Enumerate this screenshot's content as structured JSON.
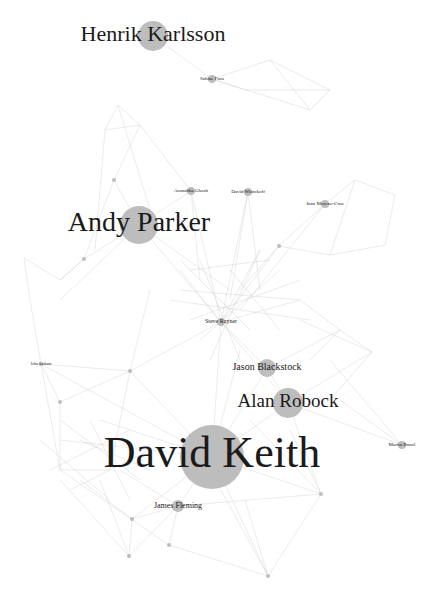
{
  "diagram": {
    "type": "network-graph",
    "colors": {
      "background": "#ffffff",
      "edge": "#c8c8c8",
      "node": "#bdbdbd",
      "label": "#1a1a1a"
    },
    "nodes": [
      {
        "id": "henrik-karlsson",
        "label": "Henrik Karlsson",
        "x": 153,
        "y": 36,
        "r": 15,
        "fs": 22
      },
      {
        "id": "sabine-fuss",
        "label": "Sabine Fuss",
        "x": 212,
        "y": 79,
        "r": 4,
        "fs": 5
      },
      {
        "id": "andy-parker",
        "label": "Andy Parker",
        "x": 139,
        "y": 225,
        "r": 19,
        "fs": 28
      },
      {
        "id": "arunabha-ghosh",
        "label": "Arunabha Ghosh",
        "x": 191,
        "y": 191,
        "r": 4,
        "fs": 5
      },
      {
        "id": "david-winickoff",
        "label": "David Winickoff",
        "x": 248,
        "y": 192,
        "r": 4,
        "fs": 5
      },
      {
        "id": "juan-moreno-cruz",
        "label": "Juan Moreno-Cruz",
        "x": 325,
        "y": 204,
        "r": 4,
        "fs": 5
      },
      {
        "id": "small-1",
        "label": "",
        "x": 114,
        "y": 180,
        "r": 2,
        "fs": 3
      },
      {
        "id": "small-2",
        "label": "",
        "x": 279,
        "y": 246,
        "r": 2,
        "fs": 3
      },
      {
        "id": "small-3",
        "label": "",
        "x": 84,
        "y": 259,
        "r": 2,
        "fs": 3
      },
      {
        "id": "steve-rayner",
        "label": "Steve Rayner",
        "x": 221,
        "y": 322,
        "r": 4,
        "fs": 6
      },
      {
        "id": "jason-blackstock",
        "label": "Jason Blackstock",
        "x": 267,
        "y": 368,
        "r": 9,
        "fs": 10
      },
      {
        "id": "alan-robock",
        "label": "Alan Robock",
        "x": 288,
        "y": 403,
        "r": 15,
        "fs": 19
      },
      {
        "id": "david-keith",
        "label": "David Keith",
        "x": 212,
        "y": 457,
        "r": 32,
        "fs": 44
      },
      {
        "id": "martin-bunzl",
        "label": "Martin Bunzl",
        "x": 402,
        "y": 445,
        "r": 4,
        "fs": 5
      },
      {
        "id": "james-fleming",
        "label": "James Fleming",
        "x": 178,
        "y": 506,
        "r": 6,
        "fs": 8
      },
      {
        "id": "john-latham",
        "label": "John Latham",
        "x": 41,
        "y": 364,
        "r": 2,
        "fs": 4
      },
      {
        "id": "small-4",
        "label": "",
        "x": 130,
        "y": 371,
        "r": 2,
        "fs": 3
      },
      {
        "id": "small-5",
        "label": "",
        "x": 60,
        "y": 402,
        "r": 2,
        "fs": 3
      },
      {
        "id": "small-6",
        "label": "",
        "x": 321,
        "y": 494,
        "r": 2,
        "fs": 3
      },
      {
        "id": "small-7",
        "label": "",
        "x": 132,
        "y": 519,
        "r": 2,
        "fs": 3
      },
      {
        "id": "small-8",
        "label": "",
        "x": 169,
        "y": 545,
        "r": 2,
        "fs": 3
      },
      {
        "id": "small-9",
        "label": "",
        "x": 129,
        "y": 556,
        "r": 2,
        "fs": 3
      },
      {
        "id": "small-10",
        "label": "",
        "x": 268,
        "y": 576,
        "r": 2,
        "fs": 3
      }
    ],
    "edges": [
      [
        "henrik-karlsson",
        "sabine-fuss"
      ],
      [
        212,
        79,
        270,
        60
      ],
      [
        270,
        60,
        330,
        90
      ],
      [
        330,
        90,
        310,
        110
      ],
      [
        310,
        110,
        212,
        79
      ],
      [
        270,
        60,
        310,
        110
      ],
      [
        330,
        90,
        245,
        90
      ],
      [
        245,
        90,
        212,
        79
      ],
      [
        118,
        105,
        140,
        125
      ],
      [
        140,
        125,
        105,
        130
      ],
      [
        105,
        130,
        118,
        105
      ],
      [
        118,
        105,
        150,
        210
      ],
      [
        140,
        125,
        190,
        190
      ],
      [
        105,
        130,
        95,
        250
      ],
      [
        "small-1",
        "andy-parker"
      ],
      [
        "small-1",
        "small-3"
      ],
      [
        "small-1",
        140,
        125
      ],
      [
        "arunabha-ghosh",
        "andy-parker"
      ],
      [
        "arunabha-ghosh",
        "steve-rayner"
      ],
      [
        "arunabha-ghosh",
        200,
        280
      ],
      [
        "david-winickoff",
        230,
        300
      ],
      [
        "david-winickoff",
        "steve-rayner"
      ],
      [
        "david-winickoff",
        260,
        290
      ],
      [
        "juan-moreno-cruz",
        "small-2"
      ],
      [
        "juan-moreno-cruz",
        355,
        180
      ],
      [
        355,
        180,
        395,
        195
      ],
      [
        395,
        195,
        385,
        245
      ],
      [
        385,
        245,
        330,
        255
      ],
      [
        330,
        255,
        355,
        180
      ],
      [
        "juan-moreno-cruz",
        240,
        310
      ],
      [
        "small-2",
        "steve-rayner"
      ],
      [
        "small-2",
        240,
        290
      ],
      [
        "small-2",
        330,
        255
      ],
      [
        24,
        258,
        30,
        300
      ],
      [
        24,
        258,
        60,
        280
      ],
      [
        60,
        280,
        84,
        259
      ],
      [
        30,
        300,
        41,
        364
      ],
      [
        "small-3",
        60,
        280
      ],
      [
        "small-3",
        "andy-parker"
      ],
      [
        "andy-parker",
        230,
        290
      ],
      [
        "andy-parker",
        "steve-rayner"
      ],
      [
        "andy-parker",
        60,
        300
      ],
      [
        "steve-rayner",
        "jason-blackstock"
      ],
      [
        "steve-rayner",
        "alan-robock"
      ],
      [
        "steve-rayner",
        "david-keith"
      ],
      [
        "steve-rayner",
        180,
        270
      ],
      [
        "steve-rayner",
        260,
        250
      ],
      [
        "steve-rayner",
        300,
        300
      ],
      [
        190,
        270,
        270,
        260
      ],
      [
        180,
        290,
        300,
        300
      ],
      [
        200,
        260,
        240,
        360
      ],
      [
        260,
        250,
        210,
        360
      ],
      [
        230,
        270,
        280,
        330
      ],
      [
        280,
        270,
        200,
        340
      ],
      [
        170,
        300,
        310,
        320
      ],
      [
        190,
        320,
        300,
        280
      ],
      [
        180,
        260,
        250,
        330
      ],
      [
        300,
        300,
        340,
        330
      ],
      [
        340,
        330,
        372,
        352
      ],
      [
        372,
        352,
        330,
        400
      ],
      [
        340,
        330,
        310,
        360
      ],
      [
        300,
        320,
        372,
        352
      ],
      [
        "jason-blackstock",
        "alan-robock"
      ],
      [
        "jason-blackstock",
        "david-keith"
      ],
      [
        "jason-blackstock",
        340,
        330
      ],
      [
        "alan-robock",
        "david-keith"
      ],
      [
        "alan-robock",
        "martin-bunzl"
      ],
      [
        "alan-robock",
        372,
        352
      ],
      [
        "alan-robock",
        "small-6"
      ],
      [
        "david-keith",
        "james-fleming"
      ],
      [
        "david-keith",
        "small-6"
      ],
      [
        "david-keith",
        "john-latham"
      ],
      [
        "david-keith",
        "small-4"
      ],
      [
        "david-keith",
        "small-7"
      ],
      [
        "david-keith",
        "small-10"
      ],
      [
        "david-keith",
        60,
        440
      ],
      [
        "david-keith",
        100,
        420
      ],
      [
        "david-keith",
        240,
        350
      ],
      [
        "john-latham",
        "small-4"
      ],
      [
        "john-latham",
        "small-5"
      ],
      [
        "john-latham",
        60,
        470
      ],
      [
        "small-4",
        "small-5"
      ],
      [
        "small-4",
        "steve-rayner"
      ],
      [
        "small-4",
        150,
        290
      ],
      [
        "small-4",
        110,
        470
      ],
      [
        "small-5",
        60,
        470
      ],
      [
        60,
        470,
        110,
        470
      ],
      [
        40,
        440,
        110,
        500
      ],
      [
        60,
        420,
        140,
        480
      ],
      [
        80,
        440,
        150,
        470
      ],
      [
        50,
        470,
        130,
        430
      ],
      [
        70,
        490,
        150,
        450
      ],
      [
        90,
        420,
        130,
        500
      ],
      [
        "james-fleming",
        "small-7"
      ],
      [
        "james-fleming",
        "small-8"
      ],
      [
        "james-fleming",
        "small-6"
      ],
      [
        "james-fleming",
        120,
        470
      ],
      [
        "small-7",
        "small-9"
      ],
      [
        "small-7",
        80,
        480
      ],
      [
        "small-9",
        60,
        480
      ],
      [
        "small-9",
        100,
        480
      ],
      [
        "small-9",
        "james-fleming"
      ],
      [
        "small-8",
        60,
        470
      ],
      [
        "small-8",
        "small-10"
      ],
      [
        "small-10",
        "small-6"
      ],
      [
        "small-10",
        210,
        470
      ],
      [
        "small-10",
        245,
        500
      ],
      [
        "small-6",
        290,
        430
      ],
      [
        "small-6",
        250,
        420
      ],
      [
        "martin-bunzl",
        340,
        400
      ],
      [
        "martin-bunzl",
        330,
        360
      ]
    ]
  }
}
